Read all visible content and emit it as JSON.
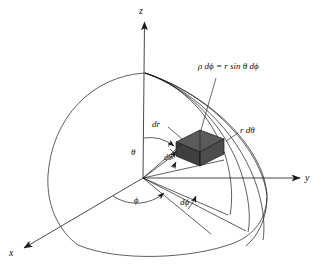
{
  "figure": {
    "background_color": "#ffffff",
    "line_color": "#1a1a1a",
    "element_fill_color": "#4a4a4a",
    "element_fill_color_light": "#5e5e5e",
    "element_fill_color_dark": "#3c3c3c"
  },
  "axes": {
    "z_label": "z",
    "y_label": "y",
    "x_label": "x"
  },
  "labels": {
    "arc_length_equation": "ρ dϕ = r sin θ dϕ",
    "rho_dphi": "ρ dϕ",
    "equals": "=",
    "r_sin_theta_dphi": "r sin θ dϕ",
    "dr": "dr",
    "r_dtheta": "r dθ",
    "r": "r",
    "theta": "θ",
    "dtheta": "dθ",
    "phi": "ϕ",
    "dphi": "dϕ"
  },
  "geometry": {
    "origin": [
      143,
      178
    ],
    "pole": [
      145,
      73
    ],
    "sphere_radius": 122,
    "element_center": [
      196,
      146
    ]
  }
}
